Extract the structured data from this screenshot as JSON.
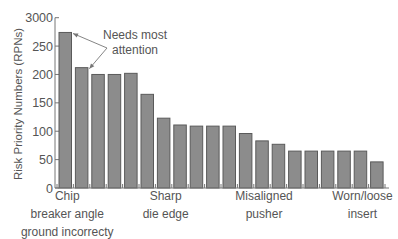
{
  "chart_data": {
    "type": "bar",
    "title": "",
    "xlabel": "",
    "ylabel": "Risk Priority Numbers (RPNs)",
    "ylim": [
      0,
      300
    ],
    "yticks": [
      0,
      50,
      100,
      150,
      200,
      250,
      300
    ],
    "ytick_labels": [
      "0",
      "50",
      "100",
      "150",
      "200",
      "250",
      "3000"
    ],
    "grid": false,
    "legend": null,
    "bar_color": "#8c8c8c",
    "bar_edge_color": "#5a5a5a",
    "categories": [
      "1",
      "2",
      "3",
      "4",
      "5",
      "6",
      "7",
      "8",
      "9",
      "10",
      "11",
      "12",
      "13",
      "14",
      "15",
      "16",
      "17",
      "18",
      "19",
      "20"
    ],
    "values": [
      274,
      212,
      200,
      200,
      202,
      165,
      123,
      111,
      109,
      109,
      109,
      96,
      83,
      77,
      65,
      65,
      65,
      65,
      65,
      46
    ],
    "category_labels": [
      {
        "bar_index": 0,
        "lines": [
          "Chip",
          "breaker angle",
          "ground incorrecty"
        ]
      },
      {
        "bar_index": 6,
        "lines": [
          "Sharp",
          "die edge"
        ]
      },
      {
        "bar_index": 12,
        "lines": [
          "Misaligned",
          "pusher"
        ]
      },
      {
        "bar_index": 18,
        "lines": [
          "Worn/loose",
          "insert"
        ]
      }
    ],
    "annotations": [
      {
        "text_lines": [
          "Needs most",
          "attention"
        ],
        "arrows_to_bar_index": [
          0,
          1
        ]
      }
    ]
  }
}
